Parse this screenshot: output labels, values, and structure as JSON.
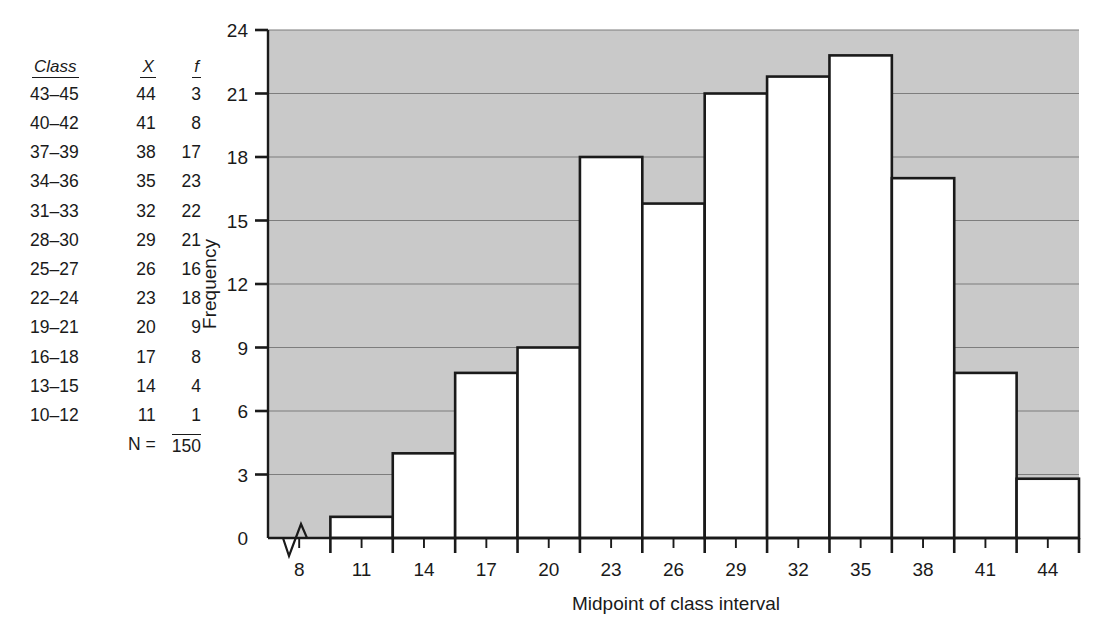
{
  "table": {
    "headers": [
      "Class",
      "X",
      "f"
    ],
    "rows": [
      {
        "class": "43–45",
        "x": "44",
        "f": "3"
      },
      {
        "class": "40–42",
        "x": "41",
        "f": "8"
      },
      {
        "class": "37–39",
        "x": "38",
        "f": "17"
      },
      {
        "class": "34–36",
        "x": "35",
        "f": "23"
      },
      {
        "class": "31–33",
        "x": "32",
        "f": "22"
      },
      {
        "class": "28–30",
        "x": "29",
        "f": "21"
      },
      {
        "class": "25–27",
        "x": "26",
        "f": "16"
      },
      {
        "class": "22–24",
        "x": "23",
        "f": "18"
      },
      {
        "class": "19–21",
        "x": "20",
        "f": "9"
      },
      {
        "class": "16–18",
        "x": "17",
        "f": "8"
      },
      {
        "class": "13–15",
        "x": "14",
        "f": "4"
      },
      {
        "class": "10–12",
        "x": "11",
        "f": "1"
      }
    ],
    "total_label": "N =",
    "total_value": "150"
  },
  "chart_data": {
    "type": "bar",
    "title": "",
    "xlabel": "Midpoint of class interval",
    "ylabel": "Frequency",
    "categories": [
      "8",
      "11",
      "14",
      "17",
      "20",
      "23",
      "26",
      "29",
      "32",
      "35",
      "38",
      "41",
      "44"
    ],
    "values": [
      0,
      1,
      4,
      7.8,
      9,
      18,
      15.8,
      21,
      21.8,
      22.8,
      17,
      7.8,
      2.8
    ],
    "table_values": [
      0,
      1,
      4,
      8,
      9,
      18,
      16,
      21,
      22,
      23,
      17,
      8,
      3
    ],
    "ylim": [
      0,
      24
    ],
    "yticks": [
      "0",
      "3",
      "6",
      "9",
      "12",
      "15",
      "18",
      "21",
      "24"
    ],
    "xticks": [
      "8",
      "11",
      "14",
      "17",
      "20",
      "23",
      "26",
      "29",
      "32",
      "35",
      "38",
      "41",
      "44"
    ],
    "grid": true,
    "legend": "none",
    "plot_background": "#c9c9c9",
    "bar_fill": "#ffffff",
    "bar_stroke": "#1a1a1a",
    "axis_color": "#1a1a1a",
    "grid_color": "#7d7d7d",
    "axis_break": "zigzag"
  }
}
